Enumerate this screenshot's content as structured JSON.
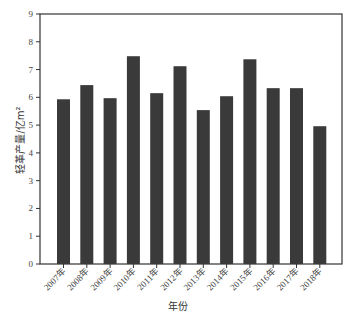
{
  "chart_data": {
    "type": "bar",
    "title": "",
    "xlabel": "年份",
    "ylabel": "轻革产量/亿m²",
    "ylim": [
      0,
      9
    ],
    "yticks": [
      0,
      1,
      2,
      3,
      4,
      5,
      6,
      7,
      8,
      9
    ],
    "grid": false,
    "legend": null,
    "categories": [
      "2007年",
      "2008年",
      "2009年",
      "2010年",
      "2011年",
      "2012年",
      "2013年",
      "2014年",
      "2015年",
      "2016年",
      "2017年",
      "2018年"
    ],
    "values": [
      5.93,
      6.44,
      5.97,
      7.48,
      6.15,
      7.12,
      5.54,
      6.04,
      7.37,
      6.33,
      6.33,
      4.96
    ],
    "bar_color": "#3a3a3a"
  }
}
